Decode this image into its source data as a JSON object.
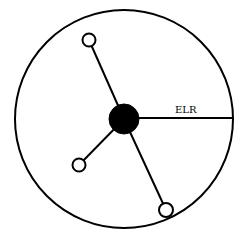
{
  "diagram": {
    "colors": {
      "stroke": "#000000",
      "background": "#ffffff",
      "central_fill": "#000000",
      "satellite_fill": "#ffffff"
    },
    "outer_circle": {
      "cx": 124,
      "cy": 119,
      "r": 109
    },
    "central_node": {
      "cx": 124,
      "cy": 119,
      "r": 15
    },
    "satellite_nodes": [
      {
        "name": "top-node",
        "cx": 89,
        "cy": 40,
        "r": 6.5
      },
      {
        "name": "lower-left-node",
        "cx": 79,
        "cy": 165,
        "r": 6.5
      },
      {
        "name": "bottom-right-node",
        "cx": 166,
        "cy": 210,
        "r": 7
      }
    ],
    "radius_line": {
      "x1": 139,
      "y1": 118,
      "x2": 233,
      "y2": 118,
      "label": "ELR"
    }
  }
}
